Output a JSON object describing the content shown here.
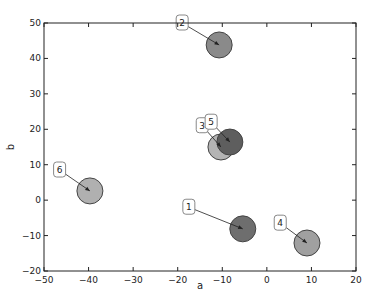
{
  "chart_data": {
    "type": "scatter",
    "title": "",
    "xlabel": "a",
    "ylabel": "b",
    "xlim": [
      -50,
      20
    ],
    "ylim": [
      -20,
      50
    ],
    "xticks": [
      "-50",
      "-40",
      "-30",
      "-20",
      "-10",
      "0",
      "10",
      "20"
    ],
    "yticks": [
      "-20",
      "-10",
      "0",
      "10",
      "20",
      "30",
      "40",
      "50"
    ],
    "grid": false,
    "points": [
      {
        "label": "1",
        "a": -5.4,
        "b": -8.1,
        "color": "#6e6e6e"
      },
      {
        "label": "2",
        "a": -10.7,
        "b": 43.8,
        "color": "#8a8a8a"
      },
      {
        "label": "3",
        "a": -10.3,
        "b": 15.0,
        "color": "#b4b4b4"
      },
      {
        "label": "4",
        "a": 9.0,
        "b": -12.1,
        "color": "#a0a0a0"
      },
      {
        "label": "5",
        "a": -8.3,
        "b": 16.4,
        "color": "#5e5e5e"
      },
      {
        "label": "6",
        "a": -39.7,
        "b": 2.6,
        "color": "#b0b0b0"
      }
    ],
    "annotations": [
      {
        "text": "1",
        "box_x": -17.5,
        "box_y": -2,
        "arrow_to": "1"
      },
      {
        "text": "2",
        "box_x": -19,
        "box_y": 50,
        "arrow_to": "2"
      },
      {
        "text": "3",
        "box_x": -14.5,
        "box_y": 21,
        "arrow_to": "3"
      },
      {
        "text": "4",
        "box_x": 3,
        "box_y": -6.5,
        "arrow_to": "4"
      },
      {
        "text": "5",
        "box_x": -12.5,
        "box_y": 22,
        "arrow_to": "5"
      },
      {
        "text": "6",
        "box_x": -46.5,
        "box_y": 8.5,
        "arrow_to": "6"
      }
    ]
  }
}
